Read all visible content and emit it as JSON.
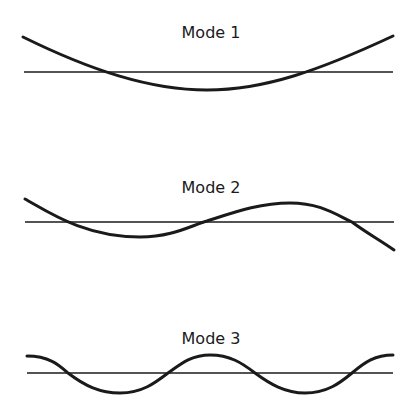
{
  "diagram": {
    "type": "vibration-mode-shapes",
    "stroke_color": "#1a1a1a",
    "background": "#ffffff",
    "modes": [
      {
        "label": "Mode 1",
        "title_pos": [
          211,
          38
        ],
        "baseline": {
          "x1": 24,
          "x2": 393,
          "y": 72
        },
        "path": "M23,37 C90,70 150,90 207,90 C265,90 320,70 393,36"
      },
      {
        "label": "Mode 2",
        "title_pos": [
          211,
          193
        ],
        "baseline": {
          "x1": 25,
          "x2": 394,
          "y": 222
        },
        "path": "M25,199 C50,213 85,237 140,237 C172,237 190,226 207,221 C235,212 260,203 290,203 C320,203 335,214 352,222 C365,232 380,240 394,250"
      },
      {
        "label": "Mode 3",
        "title_pos": [
          211,
          344
        ],
        "baseline": {
          "x1": 27,
          "x2": 393,
          "y": 373
        },
        "path": "M27,356 C50,356 60,366 68,373 C85,386 100,393 120,393 C142,393 155,383 168,373 C182,363 192,355 210,355 C230,355 242,363 255,373 C270,384 285,393 305,393 C327,393 340,383 352,373 C365,362 375,355 393,355"
      }
    ]
  }
}
